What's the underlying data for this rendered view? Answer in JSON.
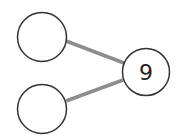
{
  "diagram": {
    "type": "number-bond",
    "whole": {
      "value": "9",
      "cx": 146,
      "cy": 72,
      "r": 24
    },
    "parts": [
      {
        "value": "",
        "cx": 42,
        "cy": 37,
        "r": 25
      },
      {
        "value": "",
        "cx": 42,
        "cy": 109,
        "r": 25
      }
    ],
    "colors": {
      "circle_stroke": "#333333",
      "connector": "#8c8c8c",
      "background": "#ffffff"
    }
  }
}
